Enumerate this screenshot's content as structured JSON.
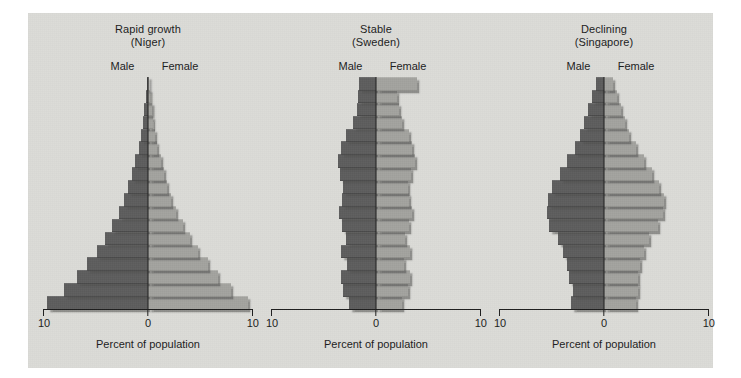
{
  "figure": {
    "background_color": "#dcdcd8",
    "male_color": "#5d5d5d",
    "female_color": "#a3a39f"
  },
  "panels": [
    {
      "title": "Rapid growth",
      "subtitle": "(Niger)",
      "male_label": "Male",
      "female_label": "Female",
      "axis_label": "Percent of population",
      "tick_left": "10",
      "tick_mid": "0",
      "tick_right": "10"
    },
    {
      "title": "Stable",
      "subtitle": "(Sweden)",
      "male_label": "Male",
      "female_label": "Female",
      "axis_label": "Percent of population",
      "tick_left": "10",
      "tick_mid": "0",
      "tick_right": "10"
    },
    {
      "title": "Declining",
      "subtitle": "(Singapore)",
      "male_label": "Male",
      "female_label": "Female",
      "axis_label": "Percent of population",
      "tick_left": "10",
      "tick_mid": "0",
      "tick_right": "10"
    }
  ],
  "chart_data": [
    {
      "type": "bar",
      "title": "Rapid growth (Niger)",
      "xlabel": "Percent of population",
      "ylabel": "",
      "xlim": [
        -10,
        10
      ],
      "xticks": [
        -10,
        0,
        10
      ],
      "xticklabels": [
        "10",
        "0",
        "10"
      ],
      "grid": false,
      "legend": [
        "Male",
        "Female"
      ],
      "legend_position": "top-inside",
      "orientation": "population-pyramid",
      "categories": [
        "0-4",
        "5-9",
        "10-14",
        "15-19",
        "20-24",
        "25-29",
        "30-34",
        "35-39",
        "40-44",
        "45-49",
        "50-54",
        "55-59",
        "60-64",
        "65-69",
        "70-74",
        "75-79",
        "80-84",
        "85+"
      ],
      "categories_order": "youngest-at-bottom",
      "series": [
        {
          "name": "Male",
          "side": "left",
          "values": [
            9.6,
            8.0,
            6.8,
            5.8,
            4.9,
            4.1,
            3.4,
            2.8,
            2.3,
            1.9,
            1.5,
            1.2,
            0.9,
            0.7,
            0.5,
            0.35,
            0.2,
            0.1
          ]
        },
        {
          "name": "Female",
          "side": "right",
          "values": [
            9.5,
            7.9,
            6.7,
            5.7,
            4.8,
            4.0,
            3.3,
            2.7,
            2.2,
            1.8,
            1.5,
            1.2,
            0.9,
            0.7,
            0.5,
            0.35,
            0.2,
            0.1
          ]
        }
      ]
    },
    {
      "type": "bar",
      "title": "Stable (Sweden)",
      "xlabel": "Percent of population",
      "ylabel": "",
      "xlim": [
        -10,
        10
      ],
      "xticks": [
        -10,
        0,
        10
      ],
      "xticklabels": [
        "10",
        "0",
        "10"
      ],
      "grid": false,
      "legend": [
        "Male",
        "Female"
      ],
      "legend_position": "top-inside",
      "orientation": "population-pyramid",
      "categories": [
        "0-4",
        "5-9",
        "10-14",
        "15-19",
        "20-24",
        "25-29",
        "30-34",
        "35-39",
        "40-44",
        "45-49",
        "50-54",
        "55-59",
        "60-64",
        "65-69",
        "70-74",
        "75-79",
        "80-84",
        "85+"
      ],
      "categories_order": "youngest-at-bottom",
      "series": [
        {
          "name": "Male",
          "side": "left",
          "values": [
            2.6,
            3.1,
            3.3,
            2.8,
            3.3,
            2.9,
            3.2,
            3.5,
            3.2,
            3.1,
            3.4,
            3.6,
            3.3,
            2.9,
            2.2,
            1.8,
            1.7,
            1.6
          ]
        },
        {
          "name": "Female",
          "side": "right",
          "values": [
            2.5,
            3.0,
            3.2,
            2.7,
            3.2,
            2.8,
            3.1,
            3.4,
            3.1,
            3.0,
            3.3,
            3.7,
            3.4,
            3.1,
            2.5,
            2.2,
            2.0,
            3.9
          ]
        }
      ]
    },
    {
      "type": "bar",
      "title": "Declining (Singapore)",
      "xlabel": "Percent of population",
      "ylabel": "",
      "xlim": [
        -10,
        10
      ],
      "xticks": [
        -10,
        0,
        10
      ],
      "xticklabels": [
        "10",
        "0",
        "10"
      ],
      "grid": false,
      "legend": [
        "Male",
        "Female"
      ],
      "legend_position": "top-inside",
      "orientation": "population-pyramid",
      "categories": [
        "0-4",
        "5-9",
        "10-14",
        "15-19",
        "20-24",
        "25-29",
        "30-34",
        "35-39",
        "40-44",
        "45-49",
        "50-54",
        "55-59",
        "60-64",
        "65-69",
        "70-74",
        "75-79",
        "80-84",
        "85+"
      ],
      "categories_order": "youngest-at-bottom",
      "series": [
        {
          "name": "Male",
          "side": "left",
          "values": [
            3.1,
            3.0,
            3.3,
            3.5,
            3.9,
            4.4,
            5.2,
            5.4,
            5.3,
            5.0,
            4.2,
            3.5,
            2.8,
            2.3,
            1.9,
            1.5,
            1.1,
            0.8
          ]
        },
        {
          "name": "Female",
          "side": "right",
          "values": [
            3.0,
            3.2,
            3.2,
            3.4,
            3.8,
            4.3,
            5.1,
            5.6,
            5.7,
            5.2,
            4.6,
            3.8,
            3.0,
            2.4,
            2.0,
            1.6,
            1.2,
            0.9
          ]
        }
      ]
    }
  ]
}
